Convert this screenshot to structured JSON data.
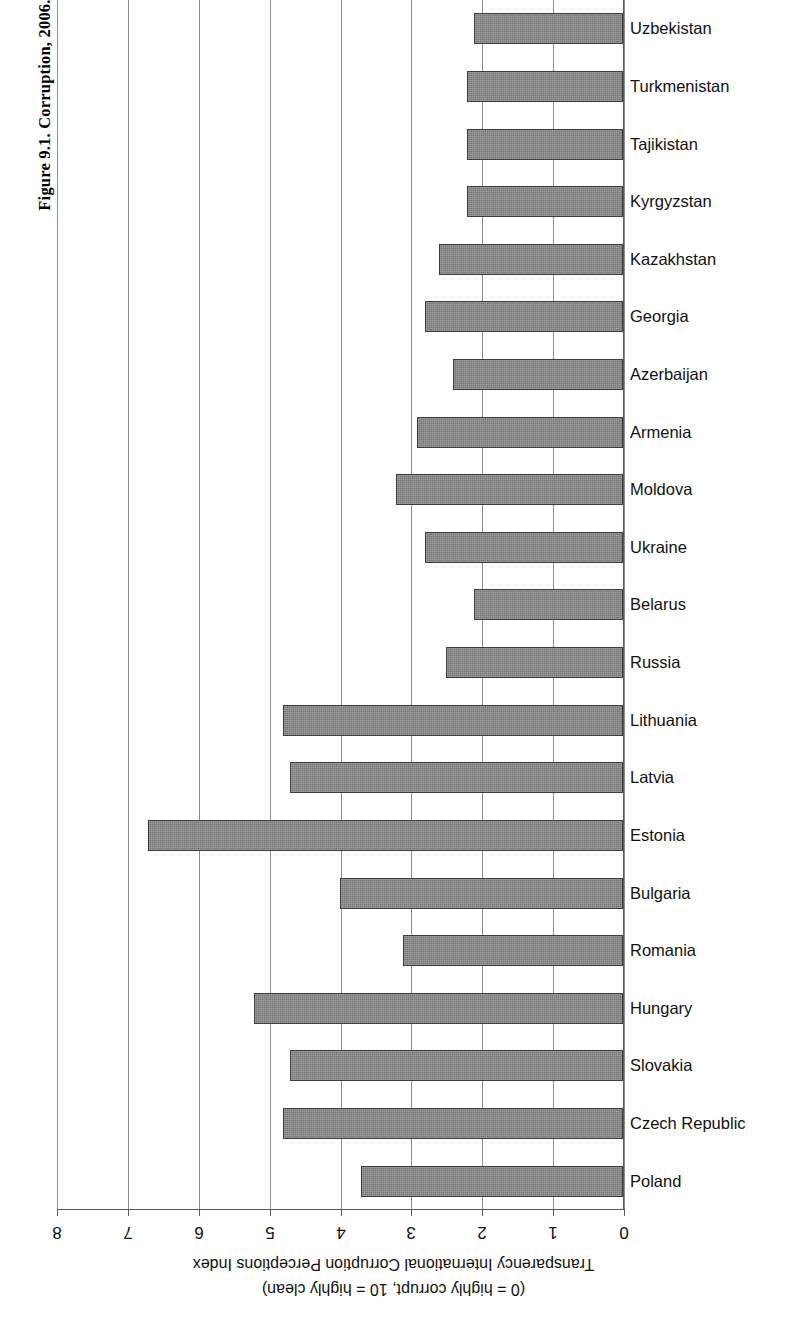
{
  "figure": {
    "title": "Figure 9.1. Corruption, 2006."
  },
  "axis": {
    "title_line1": "Transparency International Corruption Perceptions Index",
    "title_line2": "(0 = highly corrupt, 10 = highly clean)",
    "ticks": [
      "8",
      "7",
      "6",
      "5",
      "4",
      "3",
      "2",
      "1",
      "0"
    ],
    "min": 0,
    "max": 8,
    "orientation": "horizontal-reversed",
    "bar_color": "#757575",
    "bar_border_color": "#3d3d3d",
    "grid_color": "#8d8d8d"
  },
  "chart_data": {
    "type": "bar",
    "title": "Figure 9.1. Corruption, 2006.",
    "xlabel": "Transparency International Corruption Perceptions Index (0 = highly corrupt, 10 = highly clean)",
    "ylabel": "",
    "xlim": [
      0,
      8
    ],
    "grid": true,
    "legend": "none",
    "orientation": "horizontal",
    "note": "Value axis is reversed: 0 at right edge, 8 at left edge; bars grow leftwards from the 0 baseline. Category labels sit to the right of the baseline.",
    "categories": [
      "Uzbekistan",
      "Turkmenistan",
      "Tajikistan",
      "Kyrgyzstan",
      "Kazakhstan",
      "Georgia",
      "Azerbaijan",
      "Armenia",
      "Moldova",
      "Ukraine",
      "Belarus",
      "Russia",
      "Lithuania",
      "Latvia",
      "Estonia",
      "Bulgaria",
      "Romania",
      "Hungary",
      "Slovakia",
      "Czech Republic",
      "Poland"
    ],
    "values": [
      2.1,
      2.2,
      2.2,
      2.2,
      2.6,
      2.8,
      2.4,
      2.9,
      3.2,
      2.8,
      2.1,
      2.5,
      4.8,
      4.7,
      6.7,
      4.0,
      3.1,
      5.2,
      4.7,
      4.8,
      3.7
    ]
  }
}
